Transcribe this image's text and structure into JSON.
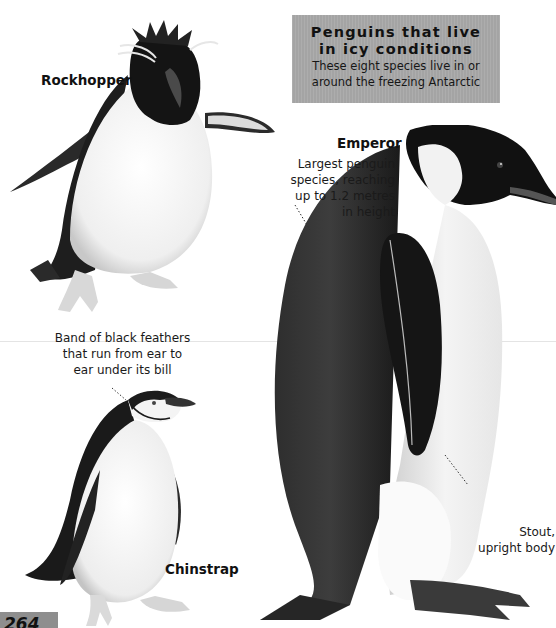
{
  "header": {
    "title_line1": "Penguins that live",
    "title_line2": "in icy conditions",
    "subtitle_line1": "These eight species live in or",
    "subtitle_line2": "around the freezing Antarctic"
  },
  "penguins": [
    {
      "name": "Rockhopper",
      "annotation": []
    },
    {
      "name": "Emperor",
      "annotation": [
        "Largest penguin",
        "species, reaching",
        "up to 1.2 metres",
        "in height"
      ],
      "annotation2": [
        "Stout,",
        "upright body"
      ]
    },
    {
      "name": "Chinstrap",
      "annotation": [
        "Band of black feathers",
        "that run from ear to",
        "ear under its bill"
      ]
    }
  ],
  "page": {
    "number": "264"
  },
  "colors": {
    "title_box": "#a9a9a9",
    "page_box": "#8e8e8e",
    "feather_dark": "#1b1b1b",
    "belly": "#f4f4f4"
  }
}
